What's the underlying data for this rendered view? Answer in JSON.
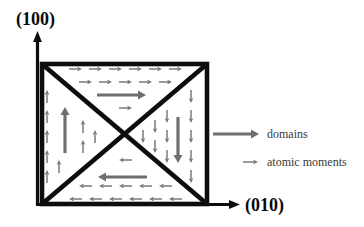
{
  "figure": {
    "axes": {
      "vertical_label": "(100)",
      "horizontal_label": "(010)"
    },
    "legend": {
      "items": [
        {
          "symbol": "thick-arrow",
          "label": "domains"
        },
        {
          "symbol": "thin-arrow",
          "label": "atomic moments"
        }
      ]
    },
    "domains": [
      {
        "position": "top",
        "moments_direction": "right"
      },
      {
        "position": "right",
        "moments_direction": "down"
      },
      {
        "position": "bottom",
        "moments_direction": "left"
      },
      {
        "position": "left",
        "moments_direction": "up"
      }
    ],
    "colors": {
      "background": "#ffffff",
      "outline": "#0d0d0d",
      "moment_arrow": "#7a7a7a",
      "domain_arrow": "#6f6f6f",
      "axis_label": "#0a0a0a",
      "legend_text": "#3a3a3a"
    }
  }
}
